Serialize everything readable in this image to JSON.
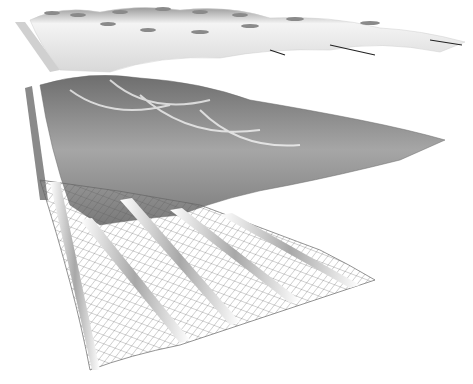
{
  "diagram": {
    "type": "exploded-layer-rendering",
    "background": "#ffffff",
    "layers": [
      {
        "name": "top-layer",
        "description": "smooth white dome surface",
        "fill": "#eeeeee",
        "shade": "#9a9a9a"
      },
      {
        "name": "middle-layer",
        "description": "textured grey wavy shell",
        "fill": "#8c8c8c",
        "shade": "#5a5a5a"
      },
      {
        "name": "bottom-layer",
        "description": "wireframe grid surface with ribs",
        "stroke": "#555555",
        "rib": "#bdbdbd"
      }
    ]
  }
}
